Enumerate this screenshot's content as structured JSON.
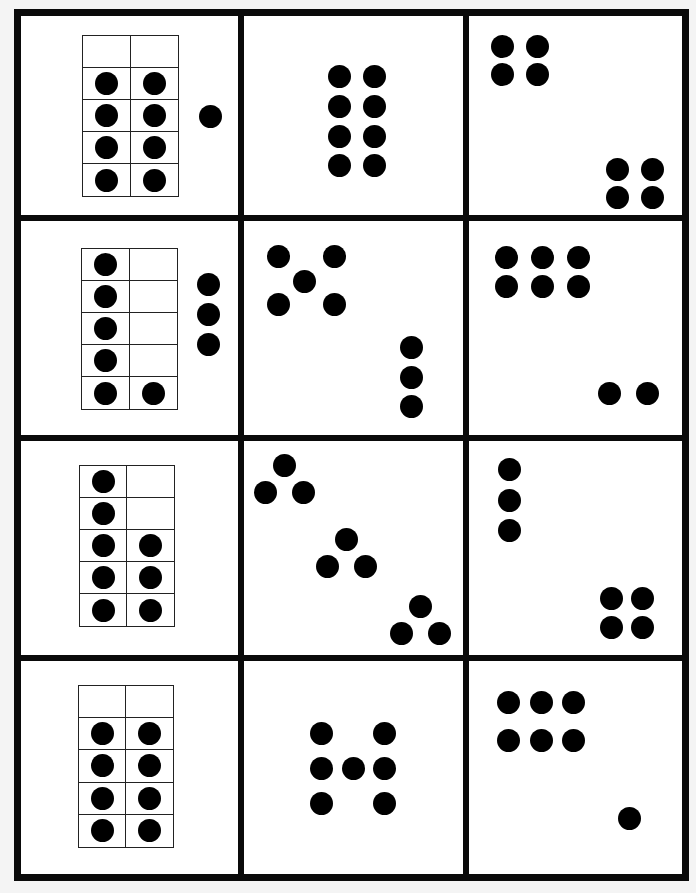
{
  "worksheet": {
    "type": "dot-card matching worksheet",
    "grid": {
      "rows": 4,
      "cols": 3
    },
    "colors": {
      "background": "#f4f4f4",
      "card": "#ffffff",
      "ink": "#000000"
    },
    "rows": [
      {
        "cards": [
          {
            "kind": "ten-frame",
            "frame": {
              "x": 82,
              "y": 35,
              "w": 97,
              "h": 162,
              "cols": 2,
              "rows": 5,
              "filled": [
                [
                  0,
                  0
                ],
                [
                  1,
                  1
                ],
                [
                  1,
                  1
                ],
                [
                  1,
                  1
                ],
                [
                  1,
                  1
                ]
              ]
            },
            "extra_dots": [
              [
                210,
                116
              ]
            ],
            "total": 9
          },
          {
            "kind": "dots",
            "dots": [
              [
                339,
                76
              ],
              [
                374,
                76
              ],
              [
                339,
                106
              ],
              [
                374,
                106
              ],
              [
                339,
                136
              ],
              [
                374,
                136
              ],
              [
                339,
                165
              ],
              [
                374,
                165
              ]
            ],
            "total": 8
          },
          {
            "kind": "dots",
            "dots": [
              [
                502,
                46
              ],
              [
                537,
                46
              ],
              [
                502,
                74
              ],
              [
                537,
                74
              ],
              [
                617,
                169
              ],
              [
                652,
                169
              ],
              [
                617,
                197
              ],
              [
                652,
                197
              ]
            ],
            "total": 8
          }
        ]
      },
      {
        "cards": [
          {
            "kind": "ten-frame",
            "frame": {
              "x": 81,
              "y": 248,
              "w": 97,
              "h": 162,
              "cols": 2,
              "rows": 5,
              "filled": [
                [
                  1,
                  0
                ],
                [
                  1,
                  0
                ],
                [
                  1,
                  0
                ],
                [
                  1,
                  0
                ],
                [
                  1,
                  1
                ]
              ]
            },
            "extra_dots": [
              [
                208,
                284
              ],
              [
                208,
                314
              ],
              [
                208,
                344
              ]
            ],
            "total": 9
          },
          {
            "kind": "dots",
            "dots": [
              [
                278,
                256
              ],
              [
                334,
                256
              ],
              [
                304,
                281
              ],
              [
                278,
                304
              ],
              [
                334,
                304
              ],
              [
                411,
                347
              ],
              [
                411,
                377
              ],
              [
                411,
                406
              ]
            ],
            "total": 8
          },
          {
            "kind": "dots",
            "dots": [
              [
                506,
                257
              ],
              [
                542,
                257
              ],
              [
                578,
                257
              ],
              [
                506,
                286
              ],
              [
                542,
                286
              ],
              [
                578,
                286
              ],
              [
                609,
                393
              ],
              [
                647,
                393
              ]
            ],
            "total": 8
          }
        ]
      },
      {
        "cards": [
          {
            "kind": "ten-frame",
            "frame": {
              "x": 79,
              "y": 465,
              "w": 96,
              "h": 162,
              "cols": 2,
              "rows": 5,
              "filled": [
                [
                  1,
                  0
                ],
                [
                  1,
                  0
                ],
                [
                  1,
                  1
                ],
                [
                  1,
                  1
                ],
                [
                  1,
                  1
                ]
              ]
            },
            "extra_dots": [],
            "total": 8
          },
          {
            "kind": "dots",
            "dots": [
              [
                284,
                465
              ],
              [
                265,
                492
              ],
              [
                303,
                492
              ],
              [
                346,
                539
              ],
              [
                327,
                566
              ],
              [
                365,
                566
              ],
              [
                420,
                606
              ],
              [
                401,
                633
              ],
              [
                439,
                633
              ]
            ],
            "total": 9
          },
          {
            "kind": "dots",
            "dots": [
              [
                509,
                469
              ],
              [
                509,
                500
              ],
              [
                509,
                530
              ],
              [
                611,
                598
              ],
              [
                642,
                598
              ],
              [
                611,
                627
              ],
              [
                642,
                627
              ]
            ],
            "total": 7
          }
        ]
      },
      {
        "cards": [
          {
            "kind": "ten-frame",
            "frame": {
              "x": 78,
              "y": 685,
              "w": 96,
              "h": 163,
              "cols": 2,
              "rows": 5,
              "filled": [
                [
                  0,
                  0
                ],
                [
                  1,
                  1
                ],
                [
                  1,
                  1
                ],
                [
                  1,
                  1
                ],
                [
                  1,
                  1
                ]
              ]
            },
            "extra_dots": [],
            "total": 8
          },
          {
            "kind": "dots",
            "dots": [
              [
                321,
                733
              ],
              [
                384,
                733
              ],
              [
                321,
                768
              ],
              [
                353,
                768
              ],
              [
                384,
                768
              ],
              [
                321,
                803
              ],
              [
                384,
                803
              ]
            ],
            "total": 7
          },
          {
            "kind": "dots",
            "dots": [
              [
                508,
                702
              ],
              [
                541,
                702
              ],
              [
                573,
                702
              ],
              [
                508,
                740
              ],
              [
                541,
                740
              ],
              [
                573,
                740
              ],
              [
                629,
                818
              ]
            ],
            "total": 7
          }
        ]
      }
    ]
  }
}
